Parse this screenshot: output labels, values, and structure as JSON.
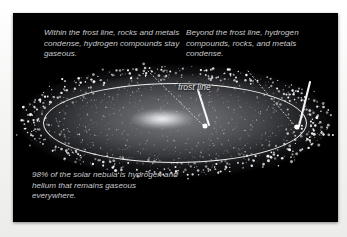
{
  "figure": {
    "background_color": "#000000",
    "page_color": "#f4f4f3",
    "text_color": "#c9cace",
    "accent_color": "#fcfcfc"
  },
  "annotations": {
    "left_note": "Within the frost line, rocks and metals condense, hydrogen compounds stay gaseous.",
    "right_note": "Beyond the frost line, hydrogen compounds, rocks, and metals condense.",
    "bottom_note": "98% of the solar nebula is hydrogen and helium that remains gaseous everywhere.",
    "frost_line_label": "frost line"
  },
  "diagram": {
    "nebula_label": "solar nebula disk",
    "center_label": "protosun bulge",
    "boundary_label": "frost line ellipse",
    "pointer_inner_label": "inner pointer marker",
    "pointer_outer_label": "outer pointer marker"
  },
  "chart_data": {
    "type": "diagram",
    "elements": [
      {
        "name": "solar nebula disk",
        "shape": "ellipse",
        "cx": 162,
        "cy": 108,
        "rx": 156,
        "ry": 56
      },
      {
        "name": "frost line",
        "shape": "ellipse",
        "cx": 162,
        "cy": 110,
        "rx": 132,
        "ry": 40
      },
      {
        "name": "protosun",
        "shape": "ellipse",
        "cx": 149,
        "cy": 106,
        "rx": 31,
        "ry": 10
      },
      {
        "name": "inner pointer",
        "shape": "rod",
        "x1": 196,
        "y1": 112,
        "x2": 185,
        "y2": 78
      },
      {
        "name": "outer pointer",
        "shape": "rod",
        "x1": 286,
        "y1": 113,
        "x2": 297,
        "y2": 70
      }
    ],
    "annotations": [
      {
        "text": "Within the frost line, rocks and metals condense, hydrogen compounds stay gaseous.",
        "points_to": "inner pointer"
      },
      {
        "text": "Beyond the frost line, hydrogen compounds, rocks, and metals condense.",
        "points_to": "outer pointer"
      },
      {
        "text": "98% of the solar nebula is hydrogen and helium that remains gaseous everywhere.",
        "points_to": null
      },
      {
        "text": "frost line",
        "points_to": "frost line"
      }
    ]
  }
}
